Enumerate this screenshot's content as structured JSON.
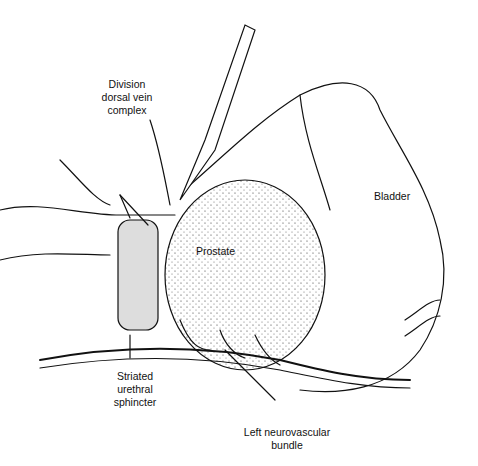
{
  "figure": {
    "type": "anatomical illustration",
    "labels": {
      "dorsal_vein": "Division\ndorsal vein\ncomplex",
      "bladder": "Bladder",
      "prostate": "Prostate",
      "sphincter": "Striated\nurethral\nsphincter",
      "neurovascular": "Left neurovascular\nbundle"
    }
  }
}
